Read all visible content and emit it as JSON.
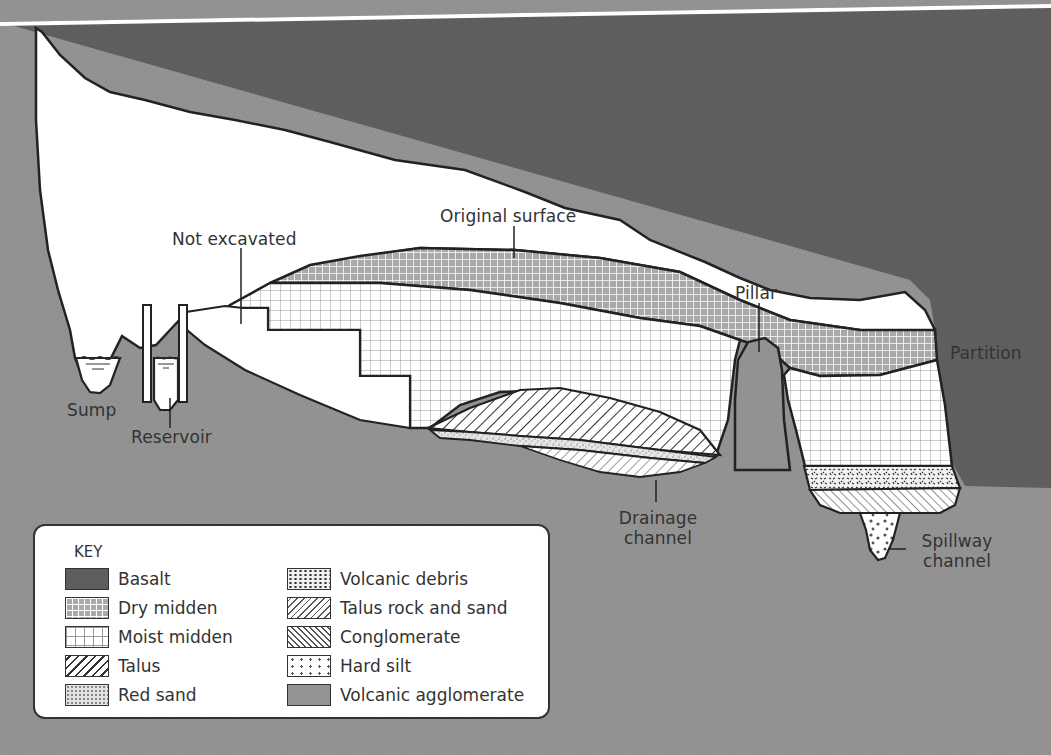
{
  "diagram": {
    "type": "geological cross-section of a cave",
    "colors": {
      "basalt": "#5e5e5e",
      "volcanic_agglomerate": "#939393",
      "cave_air": "#ffffff",
      "outline": "#222222",
      "text": "#333333"
    },
    "labels": {
      "original_surface": "Original surface",
      "not_excavated": "Not excavated",
      "pillar": "Pillar",
      "partition": "Partition",
      "sump": "Sump",
      "reservoir": "Reservoir",
      "drainage_channel_line1": "Drainage",
      "drainage_channel_line2": "channel",
      "spillway_channel_line1": "Spillway",
      "spillway_channel_line2": "channel"
    },
    "key": {
      "title": "KEY",
      "left_column": [
        {
          "label": "Basalt",
          "pattern": "basalt"
        },
        {
          "label": "Dry midden",
          "pattern": "dry-midden"
        },
        {
          "label": "Moist midden",
          "pattern": "moist-midden"
        },
        {
          "label": "Talus",
          "pattern": "talus"
        },
        {
          "label": "Red sand",
          "pattern": "red-sand"
        }
      ],
      "right_column": [
        {
          "label": "Volcanic debris",
          "pattern": "volcanic-debris"
        },
        {
          "label": "Talus rock and sand",
          "pattern": "talus-rock-sand"
        },
        {
          "label": "Conglomerate",
          "pattern": "conglomerate"
        },
        {
          "label": "Hard silt",
          "pattern": "hard-silt"
        },
        {
          "label": "Volcanic agglomerate",
          "pattern": "volcanic-agglomerate"
        }
      ]
    }
  }
}
